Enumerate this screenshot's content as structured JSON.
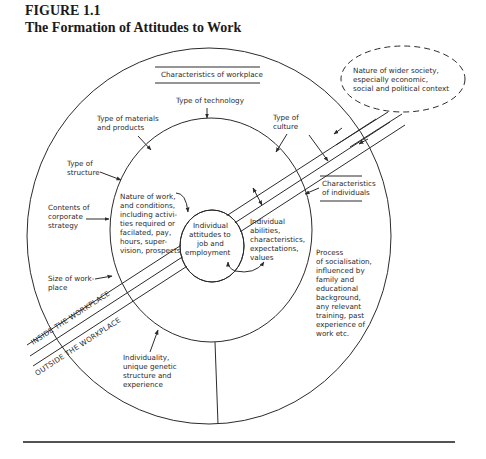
{
  "figure": {
    "number": "FIGURE 1.1",
    "title": "The Formation of Attitudes to Work"
  },
  "headings": {
    "workplace": "Characteristics of workplace",
    "individuals_line1": "Characteristics",
    "individuals_line2": "of individuals"
  },
  "wider_society": {
    "line1": "Nature of wider society,",
    "line2": "especially economic,",
    "line3": "social and political context"
  },
  "workplace_factors": {
    "technology": "Type of technology",
    "materials_line1": "Type of materials",
    "materials_line2": "and products",
    "culture_line1": "Type of",
    "culture_line2": "culture",
    "structure_line1": "Type of",
    "structure_line2": "structure",
    "strategy_line1": "Contents of",
    "strategy_line2": "corporate",
    "strategy_line3": "strategy",
    "size_line1": "Size of work-",
    "size_line2": "place"
  },
  "nature_of_work": [
    "Nature of work,",
    "and conditions,",
    "including activi-",
    "ties required or",
    "facilated, pay,",
    "hours, super-",
    "vision, prospects"
  ],
  "core": [
    "Individual",
    "attitudes to",
    "job and",
    "employment"
  ],
  "individual_abilities": [
    "Individual",
    "abilities,",
    "characteristics,",
    "expectations,",
    "values"
  ],
  "socialisation": [
    "Process",
    "of socialisation,",
    "influenced by",
    "family and",
    "educational",
    "background,",
    "any relevant",
    "training, past",
    "experience of",
    "work etc."
  ],
  "individuality": [
    "Individuality,",
    "unique genetic",
    "structure and",
    "experience"
  ],
  "band_labels": {
    "inside": "INSIDE THE WORKPLACE",
    "outside": "OUTSIDE THE WORKPLACE"
  }
}
